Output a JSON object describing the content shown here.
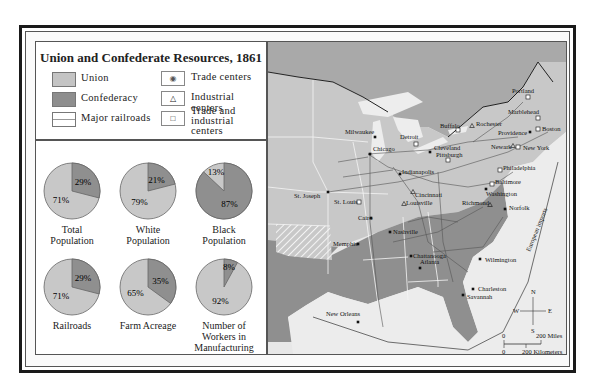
{
  "title": "Union and Confederate Resources, 1861",
  "legend": {
    "left": [
      {
        "label": "Union",
        "color": "#c4c4c4"
      },
      {
        "label": "Confederacy",
        "color": "#8e8e8e"
      },
      {
        "label": "Major railroads",
        "color": "#ffffff"
      }
    ],
    "right": [
      {
        "label": "Trade centers",
        "symbol": "◉"
      },
      {
        "label": "Industrial centers",
        "symbol": "△"
      },
      {
        "label_line1": "Trade and industrial",
        "label_line2": "centers",
        "symbol": "□"
      }
    ]
  },
  "colors": {
    "union": "#c8c8c8",
    "confederacy": "#8f8f8f",
    "land_other": "#d9d9d9",
    "water": "#ececec"
  },
  "chart_data": {
    "type": "pie",
    "title": "Union and Confederate Resources, 1861",
    "charts": [
      {
        "name_line1": "Total",
        "name_line2": "Population",
        "union": 71,
        "confederacy": 29,
        "union_label": "71%",
        "confed_label": "29%"
      },
      {
        "name_line1": "White",
        "name_line2": "Population",
        "union": 79,
        "confederacy": 21,
        "union_label": "79%",
        "confed_label": "21%"
      },
      {
        "name_line1": "Black",
        "name_line2": "Population",
        "union": 13,
        "confederacy": 87,
        "union_label": "13%",
        "confed_label": "87%"
      },
      {
        "name_line1": "Railroads",
        "name_line2": "",
        "union": 71,
        "confederacy": 29,
        "union_label": "71%",
        "confed_label": "29%"
      },
      {
        "name_line1": "Farm Acreage",
        "name_line2": "",
        "union": 65,
        "confederacy": 35,
        "union_label": "65%",
        "confed_label": "35%"
      },
      {
        "name_line1": "Number of",
        "name_line2": "Workers in",
        "name_line3": "Manufacturing",
        "union": 92,
        "confederacy": 8,
        "union_label": "92%",
        "confed_label": "8%"
      }
    ]
  },
  "map": {
    "cities": [
      {
        "name": "Milwaukee",
        "type": "trade"
      },
      {
        "name": "Chicago",
        "type": "trade"
      },
      {
        "name": "Detroit",
        "type": "both"
      },
      {
        "name": "Buffalo",
        "type": "both"
      },
      {
        "name": "Rochester",
        "type": "industrial"
      },
      {
        "name": "Portland",
        "type": "both"
      },
      {
        "name": "Marblehead",
        "type": "both"
      },
      {
        "name": "Boston",
        "type": "both"
      },
      {
        "name": "Providence",
        "type": "trade"
      },
      {
        "name": "Newark",
        "type": "industrial"
      },
      {
        "name": "New York",
        "type": "both"
      },
      {
        "name": "Cleveland",
        "type": "trade"
      },
      {
        "name": "Pittsburgh",
        "type": "both"
      },
      {
        "name": "Philadelphia",
        "type": "both"
      },
      {
        "name": "Baltimore",
        "type": "both"
      },
      {
        "name": "Washington",
        "type": "trade"
      },
      {
        "name": "Indianapolis",
        "type": "trade"
      },
      {
        "name": "Cincinnati",
        "type": "industrial"
      },
      {
        "name": "St. Joseph",
        "type": "trade"
      },
      {
        "name": "St. Louis",
        "type": "both"
      },
      {
        "name": "Louisville",
        "type": "industrial"
      },
      {
        "name": "Cairo",
        "type": "trade"
      },
      {
        "name": "Richmond",
        "type": "industrial"
      },
      {
        "name": "Norfolk",
        "type": "trade"
      },
      {
        "name": "Nashville",
        "type": "trade"
      },
      {
        "name": "Memphis",
        "type": "trade"
      },
      {
        "name": "Chattanooga",
        "type": "trade"
      },
      {
        "name": "Atlanta",
        "type": "trade"
      },
      {
        "name": "Wilmington",
        "type": "trade"
      },
      {
        "name": "Charleston",
        "type": "trade"
      },
      {
        "name": "Savannah",
        "type": "trade"
      },
      {
        "name": "New Orleans",
        "type": "trade"
      }
    ],
    "route_label": "European imports",
    "compass": {
      "n": "N",
      "s": "S",
      "e": "E",
      "w": "W"
    },
    "scale": {
      "miles_zero": "0",
      "miles_label": "200  Miles",
      "km_zero": "0",
      "km_label": "200  Kilometers"
    }
  }
}
